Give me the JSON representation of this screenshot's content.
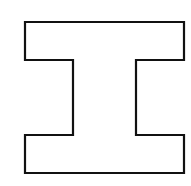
{
  "diagram": {
    "shape": "i-beam-outline",
    "stroke_color": "#111111",
    "fill_color": "#ffffff",
    "stroke_width": 2.2,
    "points": "25,22 184,22 184,60 136,60 136,135 184,135 184,173 25,173 25,135 73,135 73,60 25,60"
  }
}
